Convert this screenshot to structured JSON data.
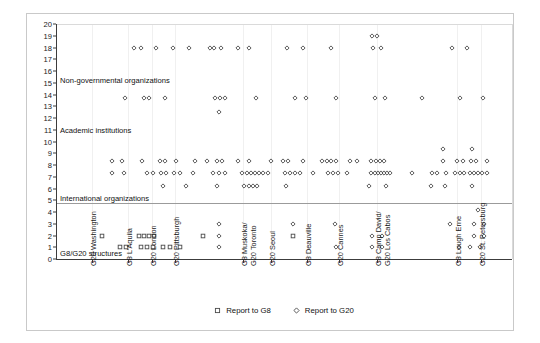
{
  "chart_data": {
    "type": "scatter",
    "title": "",
    "xlabel": "",
    "ylabel": "",
    "ylim": [
      0,
      20
    ],
    "yticks": [
      0,
      1,
      2,
      3,
      4,
      5,
      6,
      7,
      8,
      9,
      10,
      11,
      12,
      13,
      14,
      15,
      16,
      17,
      18,
      19,
      20
    ],
    "grid": true,
    "legend_position": "bottom",
    "categories": [
      "G20 Washington",
      "G8 L'Aquila",
      "G20 London",
      "G20 Pittsburgh",
      "G8 Muskoka/ G20 Toronto",
      "G20 Seoul",
      "G8 Deauville",
      "G20 Cannes",
      "G8 Camp David/ G20 Los Cabos",
      "G8 Lough Erne",
      "G20 St. Petersburg"
    ],
    "category_lines": [
      [
        "G20 Washington"
      ],
      [
        "G8 L'Aquila"
      ],
      [
        "G20 London"
      ],
      [
        "G20 Pittsburgh"
      ],
      [
        "G8  Muskoka/",
        "G20 Toronto"
      ],
      [
        "G20 Seoul"
      ],
      [
        "G8 Deauville"
      ],
      [
        "G20 Cannes"
      ],
      [
        "G8 Camp David/",
        "G20 Los Cabos"
      ],
      [
        "G8 Lough Erne"
      ],
      [
        "G20 St. Petersburg"
      ]
    ],
    "category_x_px": [
      92,
      128,
      152,
      175,
      243,
      271,
      307,
      339,
      377,
      457,
      481
    ],
    "zone_bands": [
      {
        "label": "Non-governmental organizations",
        "y": 15.2
      },
      {
        "label": "Academic institutions",
        "y": 11.0
      },
      {
        "label": "International organizations",
        "y": 5.2
      },
      {
        "label": "G8/G20 structures",
        "y": 0.5
      }
    ],
    "separator_lines": [
      4.75,
      0
    ],
    "series": [
      {
        "name": "Report to G8",
        "marker": "square",
        "color": "#555555"
      },
      {
        "name": "Report to G20",
        "marker": "diamond",
        "color": "#555555"
      }
    ],
    "points": [
      {
        "x": 134,
        "y": 18,
        "m": "d"
      },
      {
        "x": 141,
        "y": 18,
        "m": "d"
      },
      {
        "x": 156,
        "y": 18,
        "m": "d"
      },
      {
        "x": 173,
        "y": 18,
        "m": "d"
      },
      {
        "x": 189,
        "y": 18,
        "m": "d"
      },
      {
        "x": 210,
        "y": 18,
        "m": "d"
      },
      {
        "x": 214,
        "y": 18,
        "m": "d"
      },
      {
        "x": 221,
        "y": 18,
        "m": "d"
      },
      {
        "x": 238,
        "y": 18,
        "m": "d"
      },
      {
        "x": 249,
        "y": 18,
        "m": "d"
      },
      {
        "x": 287,
        "y": 18,
        "m": "d"
      },
      {
        "x": 303,
        "y": 18,
        "m": "d"
      },
      {
        "x": 331,
        "y": 18,
        "m": "d"
      },
      {
        "x": 372,
        "y": 19,
        "m": "d"
      },
      {
        "x": 377,
        "y": 19,
        "m": "d"
      },
      {
        "x": 373,
        "y": 18,
        "m": "d"
      },
      {
        "x": 381,
        "y": 18,
        "m": "d"
      },
      {
        "x": 452,
        "y": 18,
        "m": "d"
      },
      {
        "x": 467,
        "y": 18,
        "m": "d"
      },
      {
        "x": 125,
        "y": 13.7,
        "m": "d"
      },
      {
        "x": 144,
        "y": 13.7,
        "m": "d"
      },
      {
        "x": 149,
        "y": 13.7,
        "m": "d"
      },
      {
        "x": 165,
        "y": 13.7,
        "m": "d"
      },
      {
        "x": 215,
        "y": 13.7,
        "m": "d"
      },
      {
        "x": 220,
        "y": 13.7,
        "m": "d"
      },
      {
        "x": 225,
        "y": 13.7,
        "m": "d"
      },
      {
        "x": 219,
        "y": 12.5,
        "m": "d"
      },
      {
        "x": 256,
        "y": 13.7,
        "m": "d"
      },
      {
        "x": 295,
        "y": 13.7,
        "m": "d"
      },
      {
        "x": 306,
        "y": 13.7,
        "m": "d"
      },
      {
        "x": 336,
        "y": 13.7,
        "m": "d"
      },
      {
        "x": 375,
        "y": 13.7,
        "m": "d"
      },
      {
        "x": 385,
        "y": 13.7,
        "m": "d"
      },
      {
        "x": 422,
        "y": 13.7,
        "m": "d"
      },
      {
        "x": 460,
        "y": 13.7,
        "m": "d"
      },
      {
        "x": 483,
        "y": 13.7,
        "m": "d"
      },
      {
        "x": 112,
        "y": 8.35,
        "m": "d"
      },
      {
        "x": 122,
        "y": 8.35,
        "m": "d"
      },
      {
        "x": 112,
        "y": 7.35,
        "m": "d"
      },
      {
        "x": 124,
        "y": 7.35,
        "m": "d"
      },
      {
        "x": 142,
        "y": 8.35,
        "m": "d"
      },
      {
        "x": 160,
        "y": 8.35,
        "m": "d"
      },
      {
        "x": 165,
        "y": 8.35,
        "m": "d"
      },
      {
        "x": 176,
        "y": 8.35,
        "m": "d"
      },
      {
        "x": 147,
        "y": 7.35,
        "m": "d"
      },
      {
        "x": 153,
        "y": 7.35,
        "m": "d"
      },
      {
        "x": 161,
        "y": 7.35,
        "m": "d"
      },
      {
        "x": 166,
        "y": 7.35,
        "m": "d"
      },
      {
        "x": 174,
        "y": 7.35,
        "m": "d"
      },
      {
        "x": 180,
        "y": 7.35,
        "m": "d"
      },
      {
        "x": 163,
        "y": 6.25,
        "m": "d"
      },
      {
        "x": 186,
        "y": 6.25,
        "m": "d"
      },
      {
        "x": 195,
        "y": 8.35,
        "m": "d"
      },
      {
        "x": 207,
        "y": 8.35,
        "m": "d"
      },
      {
        "x": 217,
        "y": 8.35,
        "m": "d"
      },
      {
        "x": 222,
        "y": 8.35,
        "m": "d"
      },
      {
        "x": 193,
        "y": 7.35,
        "m": "d"
      },
      {
        "x": 213,
        "y": 7.35,
        "m": "d"
      },
      {
        "x": 219,
        "y": 7.35,
        "m": "d"
      },
      {
        "x": 225,
        "y": 7.35,
        "m": "d"
      },
      {
        "x": 217,
        "y": 6.25,
        "m": "d"
      },
      {
        "x": 238,
        "y": 8.35,
        "m": "d"
      },
      {
        "x": 249,
        "y": 8.35,
        "m": "d"
      },
      {
        "x": 242,
        "y": 7.35,
        "m": "d"
      },
      {
        "x": 247,
        "y": 7.35,
        "m": "d"
      },
      {
        "x": 251,
        "y": 7.35,
        "m": "d"
      },
      {
        "x": 255,
        "y": 7.35,
        "m": "d"
      },
      {
        "x": 259,
        "y": 7.35,
        "m": "d"
      },
      {
        "x": 263,
        "y": 7.35,
        "m": "d"
      },
      {
        "x": 244,
        "y": 6.25,
        "m": "d"
      },
      {
        "x": 249,
        "y": 6.25,
        "m": "d"
      },
      {
        "x": 253,
        "y": 6.25,
        "m": "d"
      },
      {
        "x": 257,
        "y": 6.25,
        "m": "d"
      },
      {
        "x": 271,
        "y": 8.35,
        "m": "d"
      },
      {
        "x": 283,
        "y": 8.35,
        "m": "d"
      },
      {
        "x": 288,
        "y": 8.35,
        "m": "d"
      },
      {
        "x": 268,
        "y": 7.35,
        "m": "d"
      },
      {
        "x": 285,
        "y": 7.35,
        "m": "d"
      },
      {
        "x": 290,
        "y": 7.35,
        "m": "d"
      },
      {
        "x": 295,
        "y": 7.35,
        "m": "d"
      },
      {
        "x": 300,
        "y": 7.35,
        "m": "d"
      },
      {
        "x": 286,
        "y": 6.25,
        "m": "d"
      },
      {
        "x": 303,
        "y": 8.35,
        "m": "d"
      },
      {
        "x": 322,
        "y": 8.35,
        "m": "d"
      },
      {
        "x": 327,
        "y": 8.35,
        "m": "d"
      },
      {
        "x": 331,
        "y": 8.35,
        "m": "d"
      },
      {
        "x": 336,
        "y": 8.35,
        "m": "d"
      },
      {
        "x": 313,
        "y": 7.35,
        "m": "d"
      },
      {
        "x": 328,
        "y": 7.35,
        "m": "d"
      },
      {
        "x": 333,
        "y": 7.35,
        "m": "d"
      },
      {
        "x": 338,
        "y": 7.35,
        "m": "d"
      },
      {
        "x": 350,
        "y": 8.35,
        "m": "d"
      },
      {
        "x": 357,
        "y": 8.35,
        "m": "d"
      },
      {
        "x": 347,
        "y": 7.35,
        "m": "d"
      },
      {
        "x": 371,
        "y": 8.35,
        "m": "d"
      },
      {
        "x": 376,
        "y": 8.35,
        "m": "d"
      },
      {
        "x": 380,
        "y": 8.35,
        "m": "d"
      },
      {
        "x": 384,
        "y": 8.35,
        "m": "d"
      },
      {
        "x": 371,
        "y": 7.35,
        "m": "d"
      },
      {
        "x": 375,
        "y": 7.35,
        "m": "d"
      },
      {
        "x": 378,
        "y": 7.35,
        "m": "d"
      },
      {
        "x": 381,
        "y": 7.35,
        "m": "d"
      },
      {
        "x": 384,
        "y": 7.35,
        "m": "d"
      },
      {
        "x": 387,
        "y": 7.35,
        "m": "d"
      },
      {
        "x": 390,
        "y": 7.35,
        "m": "d"
      },
      {
        "x": 369,
        "y": 6.25,
        "m": "d"
      },
      {
        "x": 386,
        "y": 6.25,
        "m": "d"
      },
      {
        "x": 412,
        "y": 7.35,
        "m": "d"
      },
      {
        "x": 432,
        "y": 7.35,
        "m": "d"
      },
      {
        "x": 437,
        "y": 7.35,
        "m": "d"
      },
      {
        "x": 431,
        "y": 6.25,
        "m": "d"
      },
      {
        "x": 443,
        "y": 8.35,
        "m": "d"
      },
      {
        "x": 446,
        "y": 7.35,
        "m": "d"
      },
      {
        "x": 445,
        "y": 6.25,
        "m": "d"
      },
      {
        "x": 443,
        "y": 9.4,
        "m": "d"
      },
      {
        "x": 457,
        "y": 8.35,
        "m": "d"
      },
      {
        "x": 463,
        "y": 8.35,
        "m": "d"
      },
      {
        "x": 455,
        "y": 7.35,
        "m": "d"
      },
      {
        "x": 460,
        "y": 7.35,
        "m": "d"
      },
      {
        "x": 464,
        "y": 7.35,
        "m": "d"
      },
      {
        "x": 472,
        "y": 9.4,
        "m": "d"
      },
      {
        "x": 471,
        "y": 8.35,
        "m": "d"
      },
      {
        "x": 476,
        "y": 8.35,
        "m": "d"
      },
      {
        "x": 487,
        "y": 8.35,
        "m": "d"
      },
      {
        "x": 470,
        "y": 7.35,
        "m": "d"
      },
      {
        "x": 474,
        "y": 7.35,
        "m": "d"
      },
      {
        "x": 478,
        "y": 7.35,
        "m": "d"
      },
      {
        "x": 482,
        "y": 7.35,
        "m": "d"
      },
      {
        "x": 487,
        "y": 7.35,
        "m": "d"
      },
      {
        "x": 472,
        "y": 6.25,
        "m": "d"
      },
      {
        "x": 102,
        "y": 2,
        "m": "s"
      },
      {
        "x": 120,
        "y": 1,
        "m": "s"
      },
      {
        "x": 126,
        "y": 1,
        "m": "s"
      },
      {
        "x": 139,
        "y": 2,
        "m": "s"
      },
      {
        "x": 144,
        "y": 2,
        "m": "s"
      },
      {
        "x": 149,
        "y": 2,
        "m": "s"
      },
      {
        "x": 154,
        "y": 2,
        "m": "s"
      },
      {
        "x": 141,
        "y": 1,
        "m": "s"
      },
      {
        "x": 147,
        "y": 1,
        "m": "s"
      },
      {
        "x": 153,
        "y": 1,
        "m": "s"
      },
      {
        "x": 163,
        "y": 1,
        "m": "s"
      },
      {
        "x": 170,
        "y": 1,
        "m": "s"
      },
      {
        "x": 180,
        "y": 1,
        "m": "s"
      },
      {
        "x": 203,
        "y": 2,
        "m": "s"
      },
      {
        "x": 219,
        "y": 3,
        "m": "d"
      },
      {
        "x": 219,
        "y": 2,
        "m": "d"
      },
      {
        "x": 219,
        "y": 1,
        "m": "d"
      },
      {
        "x": 293,
        "y": 3,
        "m": "d"
      },
      {
        "x": 293,
        "y": 2,
        "m": "s"
      },
      {
        "x": 335,
        "y": 3,
        "m": "d"
      },
      {
        "x": 336,
        "y": 1,
        "m": "d"
      },
      {
        "x": 372,
        "y": 2,
        "m": "d"
      },
      {
        "x": 382,
        "y": 2,
        "m": "d"
      },
      {
        "x": 372,
        "y": 1,
        "m": "d"
      },
      {
        "x": 382,
        "y": 1,
        "m": "d"
      },
      {
        "x": 450,
        "y": 3,
        "m": "d"
      },
      {
        "x": 459,
        "y": 1,
        "m": "d"
      },
      {
        "x": 478,
        "y": 4.2,
        "m": "d"
      },
      {
        "x": 474,
        "y": 3,
        "m": "d"
      },
      {
        "x": 484,
        "y": 3,
        "m": "d"
      },
      {
        "x": 474,
        "y": 2,
        "m": "d"
      },
      {
        "x": 484,
        "y": 2,
        "m": "d"
      },
      {
        "x": 470,
        "y": 1,
        "m": "d"
      },
      {
        "x": 480,
        "y": 1,
        "m": "d"
      }
    ]
  },
  "legend": {
    "items": [
      {
        "label": "Report to G8",
        "marker": "square"
      },
      {
        "label": "Report to G20",
        "marker": "diamond"
      }
    ]
  }
}
